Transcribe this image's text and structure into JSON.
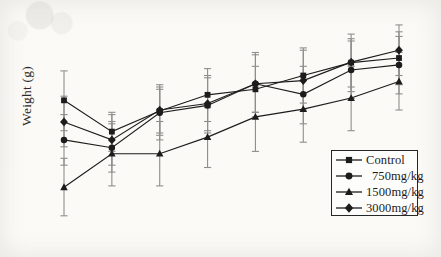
{
  "figure": {
    "ylabel": "Weight (g)",
    "background_color": "#fbfaf7",
    "ink_color": "#1c1c1c"
  },
  "legend": {
    "position": "bottom-right",
    "entries": [
      {
        "label": "Control",
        "marker": "square",
        "indent": false
      },
      {
        "label": "750mg/kg",
        "marker": "circle",
        "indent": true
      },
      {
        "label": "1500mg/kg",
        "marker": "triangle",
        "indent": false
      },
      {
        "label": "3000mg/kg",
        "marker": "diamond",
        "indent": false
      }
    ]
  },
  "chart_data": {
    "type": "line",
    "title": "",
    "subtitle": "",
    "xlabel": "",
    "ylabel": "Weight (g)",
    "x": [
      1,
      2,
      3,
      4,
      5,
      6,
      7,
      8
    ],
    "xtick_labels": [],
    "ytick_labels": [],
    "grid": false,
    "axis_lines_visible": false,
    "error_bars": "mean +/- SD, vertical with caps",
    "legend_position": "bottom-right",
    "xlim": [
      0.6,
      8.4
    ],
    "ylim": [
      0,
      100
    ],
    "series": [
      {
        "name": "Control",
        "marker": "square",
        "values": [
          64.2,
          50.6,
          59.6,
          66.6,
          69.0,
          75.0,
          80.6,
          82.6
        ],
        "err_low": [
          51.0,
          42.0,
          50.0,
          55.0,
          59.0,
          63.0,
          70.0,
          71.0
        ],
        "err_high": [
          77.0,
          59.0,
          69.0,
          78.0,
          79.0,
          87.0,
          91.0,
          94.0
        ]
      },
      {
        "name": "750mg/kg",
        "marker": "circle",
        "values": [
          47.0,
          43.6,
          58.8,
          62.0,
          71.4,
          66.8,
          77.4,
          79.6
        ],
        "err_low": [
          36.0,
          33.0,
          47.0,
          50.0,
          57.0,
          54.0,
          65.0,
          67.0
        ],
        "err_high": [
          58.0,
          54.0,
          70.0,
          74.0,
          85.0,
          79.0,
          90.0,
          92.0
        ]
      },
      {
        "name": "1500mg/kg",
        "marker": "triangle",
        "values": [
          26.4,
          41.0,
          41.0,
          48.2,
          57.0,
          60.4,
          65.2,
          72.4
        ],
        "err_low": [
          14.0,
          27.0,
          27.0,
          35.0,
          42.0,
          46.0,
          51.0,
          60.0
        ],
        "err_high": [
          39.0,
          55.0,
          55.0,
          61.0,
          72.0,
          75.0,
          79.0,
          85.0
        ]
      },
      {
        "name": "3000mg/kg",
        "marker": "diamond",
        "values": [
          54.8,
          47.0,
          60.0,
          62.8,
          71.4,
          72.8,
          80.8,
          86.0
        ],
        "err_low": [
          44.0,
          36.0,
          49.0,
          51.0,
          59.0,
          60.0,
          68.0,
          75.0
        ],
        "err_high": [
          66.0,
          58.0,
          71.0,
          75.0,
          84.0,
          86.0,
          93.0,
          97.0
        ]
      }
    ]
  }
}
